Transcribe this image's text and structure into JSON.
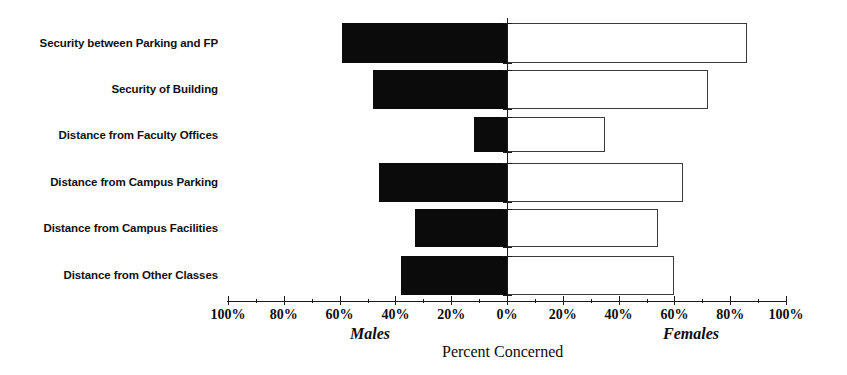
{
  "chart_data": {
    "type": "bar",
    "title": "",
    "subtitle": "",
    "orientation": "horizontal-diverging",
    "xlabel": "Percent Concerned",
    "ylabel": "",
    "xlim": [
      -100,
      100
    ],
    "grid": false,
    "legend_position": "below-axis",
    "axis_unit": "%",
    "tick_interval": 20,
    "minor_tick_interval": 10,
    "categories": [
      "Security between Parking and FP",
      "Security of Building",
      "Distance from Faculty Offices",
      "Distance from Campus Parking",
      "Distance from Campus Facilities",
      "Distance from Other Classes"
    ],
    "series": [
      {
        "name": "Males",
        "side": "left",
        "color": "#0b0b0b",
        "fill": "solid-black",
        "values": [
          59,
          48,
          12,
          46,
          33,
          38
        ]
      },
      {
        "name": "Females",
        "side": "right",
        "color": "#ffffff",
        "fill": "white-outlined",
        "values": [
          86,
          72,
          35,
          63,
          54,
          60
        ]
      }
    ],
    "tick_labels_left": [
      "100%",
      "80%",
      "60%",
      "40%",
      "20%"
    ],
    "tick_label_center": "0%",
    "tick_labels_right": [
      "20%",
      "40%",
      "60%",
      "80%",
      "100%"
    ],
    "tick_values": [
      -100,
      -80,
      -60,
      -40,
      -20,
      0,
      20,
      40,
      60,
      80,
      100
    ],
    "tick_text": [
      "100%",
      "80%",
      "60%",
      "40%",
      "20%",
      "0%",
      "20%",
      "40%",
      "60%",
      "80%",
      "100%"
    ]
  },
  "labels": {
    "males": "Males",
    "females": "Females",
    "axis_title": "Percent Concerned"
  },
  "colors": {
    "male_bar": "#0b0b0b",
    "female_bar_fill": "#ffffff",
    "female_bar_stroke": "#3a3a3a",
    "axis": "#1a1a1a",
    "text": "#0d0d0d",
    "background": "#ffffff"
  }
}
